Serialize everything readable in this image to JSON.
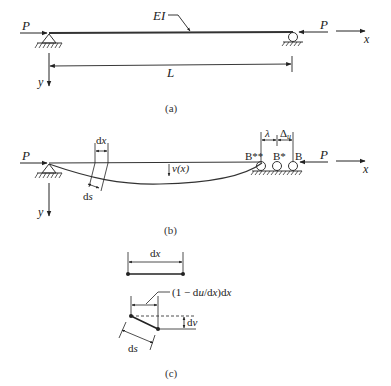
{
  "figure_a": {
    "caption": "(a)",
    "force_left": "P",
    "force_right": "P",
    "stiffness_label": "EI",
    "length_label": "L",
    "x_axis": "x",
    "y_axis": "y"
  },
  "figure_b": {
    "caption": "(b)",
    "force_left": "P",
    "force_right": "P",
    "dx_label": "dx",
    "ds_label": "ds",
    "deflection_label": "v(x)",
    "lambda_label": "λ",
    "delta_label": "Δ",
    "delta_subscript": "u",
    "point_B2": "B**",
    "point_B1": "B*",
    "point_B": "B",
    "x_axis": "x",
    "y_axis": "y"
  },
  "figure_c": {
    "caption": "(c)",
    "dx_label": "dx",
    "projection_label": "(1 − du/dx)dx",
    "dv_label": "dv",
    "ds_label": "ds"
  }
}
